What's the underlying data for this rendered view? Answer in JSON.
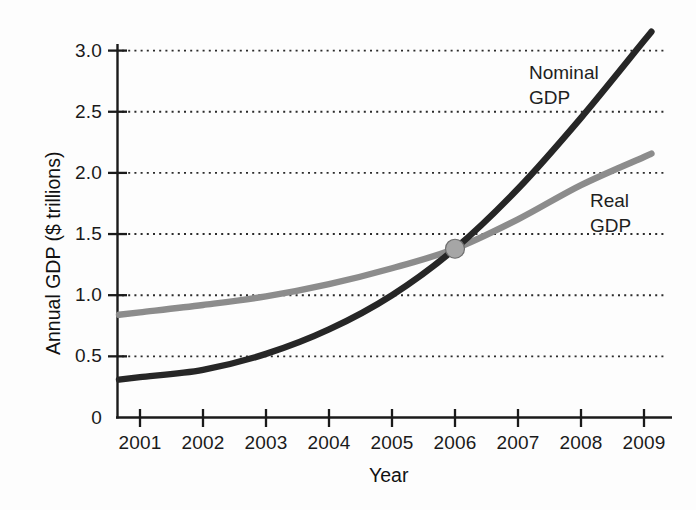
{
  "chart_data": {
    "type": "line",
    "title": "",
    "xlabel": "Year",
    "ylabel": "Annual GDP ($ trillions)",
    "xlim": [
      2000.7,
      2009.1
    ],
    "ylim": [
      0,
      3.2
    ],
    "grid": "horizontal-dotted",
    "legend_position": "inline-annotations",
    "x": [
      2001,
      2002,
      2003,
      2004,
      2005,
      2006,
      2007,
      2008,
      2009
    ],
    "series": [
      {
        "name": "Nominal GDP",
        "color": "#262626",
        "values": [
          0.33,
          0.39,
          0.52,
          0.72,
          1.0,
          1.38,
          1.87,
          2.45,
          3.08
        ]
      },
      {
        "name": "Real GDP",
        "color": "#8c8c8c",
        "values": [
          0.86,
          0.92,
          0.99,
          1.09,
          1.22,
          1.38,
          1.62,
          1.9,
          2.13
        ]
      }
    ],
    "annotations": [
      {
        "name": "intersection-marker",
        "x": 2006,
        "y": 1.38,
        "color": "#a6a6a6",
        "note": "Nominal GDP and Real GDP curves cross"
      }
    ],
    "ytick_labels": [
      "3.0",
      "2.5",
      "2.0",
      "1.5",
      "1.0",
      "0.5",
      "0"
    ],
    "ytick_values": [
      3.0,
      2.5,
      2.0,
      1.5,
      1.0,
      0.5,
      0
    ],
    "xtick_labels": [
      "2001",
      "2002",
      "2003",
      "2004",
      "2005",
      "2006",
      "2007",
      "2008",
      "2009"
    ]
  },
  "axes": {
    "y_title": "Annual GDP ($ trillions)",
    "x_title": "Year"
  },
  "series_labels": {
    "nominal_line1": "Nominal",
    "nominal_line2": "GDP",
    "real_line1": "Real",
    "real_line2": "GDP"
  },
  "yticks": [
    {
      "label": "3.0"
    },
    {
      "label": "2.5"
    },
    {
      "label": "2.0"
    },
    {
      "label": "1.5"
    },
    {
      "label": "1.0"
    },
    {
      "label": "0.5"
    },
    {
      "label": "0"
    }
  ],
  "xticks": [
    {
      "label": "2001"
    },
    {
      "label": "2002"
    },
    {
      "label": "2003"
    },
    {
      "label": "2004"
    },
    {
      "label": "2005"
    },
    {
      "label": "2006"
    },
    {
      "label": "2007"
    },
    {
      "label": "2008"
    },
    {
      "label": "2009"
    }
  ]
}
